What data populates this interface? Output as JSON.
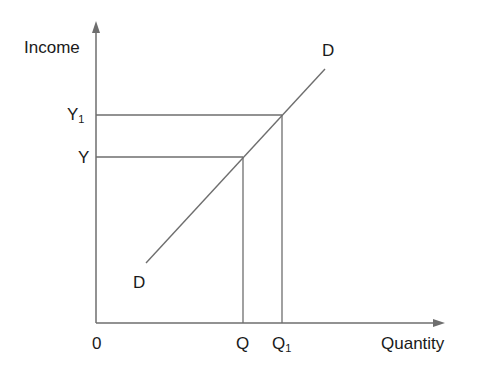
{
  "diagram": {
    "type": "income-quantity curve",
    "y_axis_label": "Income",
    "x_axis_label": "Quantity",
    "origin_label": "0",
    "curve_label_top": "D",
    "curve_label_bottom": "D",
    "y_ticks": [
      {
        "base": "Y",
        "sub": "1"
      },
      {
        "base": "Y",
        "sub": ""
      }
    ],
    "x_ticks": [
      {
        "base": "Q",
        "sub": ""
      },
      {
        "base": "Q",
        "sub": "1"
      }
    ],
    "colors": {
      "line": "#6e6e6e",
      "text": "#1a1a1a"
    }
  }
}
